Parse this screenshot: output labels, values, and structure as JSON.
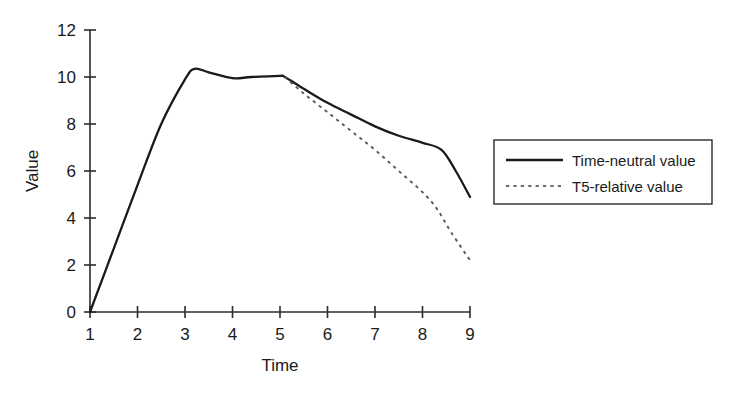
{
  "chart_data": {
    "type": "line",
    "title": "",
    "subtitle": "",
    "xlabel": "Time",
    "ylabel": "Value",
    "xlim": [
      1,
      9
    ],
    "ylim": [
      0,
      12
    ],
    "xticks": [
      "1",
      "2",
      "3",
      "4",
      "5",
      "6",
      "7",
      "8",
      "9"
    ],
    "yticks": [
      "0",
      "2",
      "4",
      "6",
      "8",
      "10",
      "12"
    ],
    "grid": false,
    "legend_position": "right",
    "series": [
      {
        "name": "Time-neutral value",
        "style": "solid",
        "color": "#1a1a1a",
        "x": [
          1.0,
          1.5,
          2.0,
          2.5,
          3.0,
          3.2,
          3.5,
          4.0,
          4.4,
          5.0,
          5.1,
          5.5,
          6.0,
          6.5,
          7.0,
          7.5,
          8.0,
          8.4,
          8.7,
          9.0
        ],
        "y": [
          0.0,
          2.7,
          5.4,
          8.0,
          9.9,
          10.35,
          10.2,
          9.95,
          10.0,
          10.05,
          10.0,
          9.5,
          8.9,
          8.4,
          7.9,
          7.5,
          7.2,
          6.9,
          6.0,
          4.9
        ]
      },
      {
        "name": "T5-relative value",
        "style": "dotted",
        "color": "#5a5a5a",
        "x": [
          5.1,
          5.5,
          6.0,
          6.5,
          7.0,
          7.5,
          8.0,
          8.3,
          8.6,
          9.0
        ],
        "y": [
          10.0,
          9.3,
          8.5,
          7.7,
          6.9,
          6.0,
          5.1,
          4.4,
          3.4,
          2.2
        ]
      }
    ],
    "legend": [
      {
        "label": "Time-neutral value",
        "style": "solid"
      },
      {
        "label": "T5-relative value",
        "style": "dotted"
      }
    ]
  }
}
